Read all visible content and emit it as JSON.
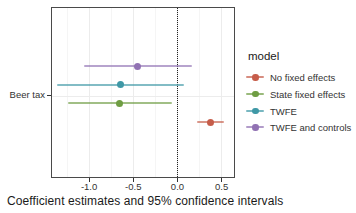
{
  "caption": "Coefficient estimates and 95% confidence intervals",
  "chart_data": {
    "type": "scatter",
    "subtype": "coefficient-forest-plot",
    "title": "",
    "caption": "Coefficient estimates and 95% confidence intervals",
    "categories": [
      "Beer tax"
    ],
    "legend_title": "model",
    "legend_position": "right",
    "xlim": [
      -1.42,
      0.64
    ],
    "x_ticks": [
      -1.0,
      -0.5,
      0.0,
      0.5
    ],
    "x_minor_gridlines": [
      -1.25,
      -0.75,
      -0.25,
      0.25
    ],
    "reference_line": {
      "x": 0.0,
      "style": "dotted",
      "color": "#222222"
    },
    "grid": "faint",
    "series": [
      {
        "name": "No fixed effects",
        "color": "#c65d4a",
        "estimate": 0.37,
        "ci_low": 0.22,
        "ci_high": 0.53
      },
      {
        "name": "State fixed effects",
        "color": "#6f9d43",
        "estimate": -0.66,
        "ci_low": -1.24,
        "ci_high": -0.06
      },
      {
        "name": "TWFE",
        "color": "#3f98a6",
        "estimate": -0.64,
        "ci_low": -1.36,
        "ci_high": 0.07
      },
      {
        "name": "TWFE and controls",
        "color": "#9172b3",
        "estimate": -0.45,
        "ci_low": -1.06,
        "ci_high": 0.16
      }
    ],
    "row_order_top_to_bottom": [
      "TWFE and controls",
      "TWFE",
      "State fixed effects",
      "No fixed effects"
    ]
  }
}
